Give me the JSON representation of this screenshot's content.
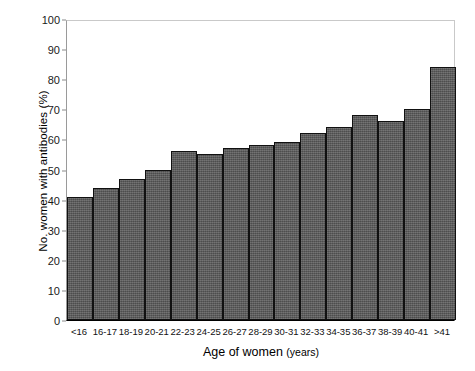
{
  "chart_data": {
    "type": "bar",
    "title": "",
    "xlabel": "Age of women",
    "xlabel_unit": "(years)",
    "ylabel": "No. women with antibodies (%)",
    "ylim": [
      0,
      100
    ],
    "yticks": [
      0,
      10,
      20,
      30,
      40,
      50,
      60,
      70,
      80,
      90,
      100
    ],
    "grid": false,
    "legend": "none",
    "bar_color": "#585858",
    "bar_edge_color": "#111111",
    "categories": [
      "<16",
      "16-17",
      "18-19",
      "20-21",
      "22-23",
      "24-25",
      "26-27",
      "28-29",
      "30-31",
      "32-33",
      "34-35",
      "36-37",
      "38-39",
      "40-41",
      ">41"
    ],
    "values": [
      41,
      44,
      47,
      50,
      56,
      55,
      57,
      58,
      59,
      62,
      64,
      68,
      66,
      70,
      84
    ]
  }
}
